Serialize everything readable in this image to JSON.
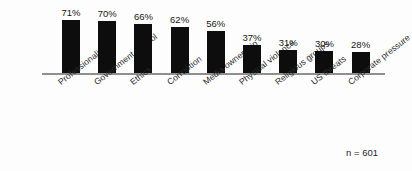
{
  "chart_data": {
    "type": "bar",
    "title": "",
    "subtitle": "",
    "xlabel": "",
    "ylabel": "",
    "ylim": [
      0,
      80
    ],
    "grid": false,
    "legend": null,
    "orientation": "vertical",
    "bar_color": "#0d0d0d",
    "axis_color": "#8f8f8f",
    "background_color": "#fdfdfd",
    "value_suffix": "%",
    "annotation": "n = 601",
    "categories": [
      "Professionalism",
      "Government control",
      "Ethics",
      "Corruption",
      "Media ownership",
      "Physical violence",
      "Religious groups",
      "US threats",
      "Corporate pressure"
    ],
    "values": [
      71,
      70,
      66,
      62,
      56,
      37,
      31,
      30,
      28
    ],
    "labels": [
      "71%",
      "70%",
      "66%",
      "62%",
      "56%",
      "37%",
      "31%",
      "30%",
      "28%"
    ]
  }
}
